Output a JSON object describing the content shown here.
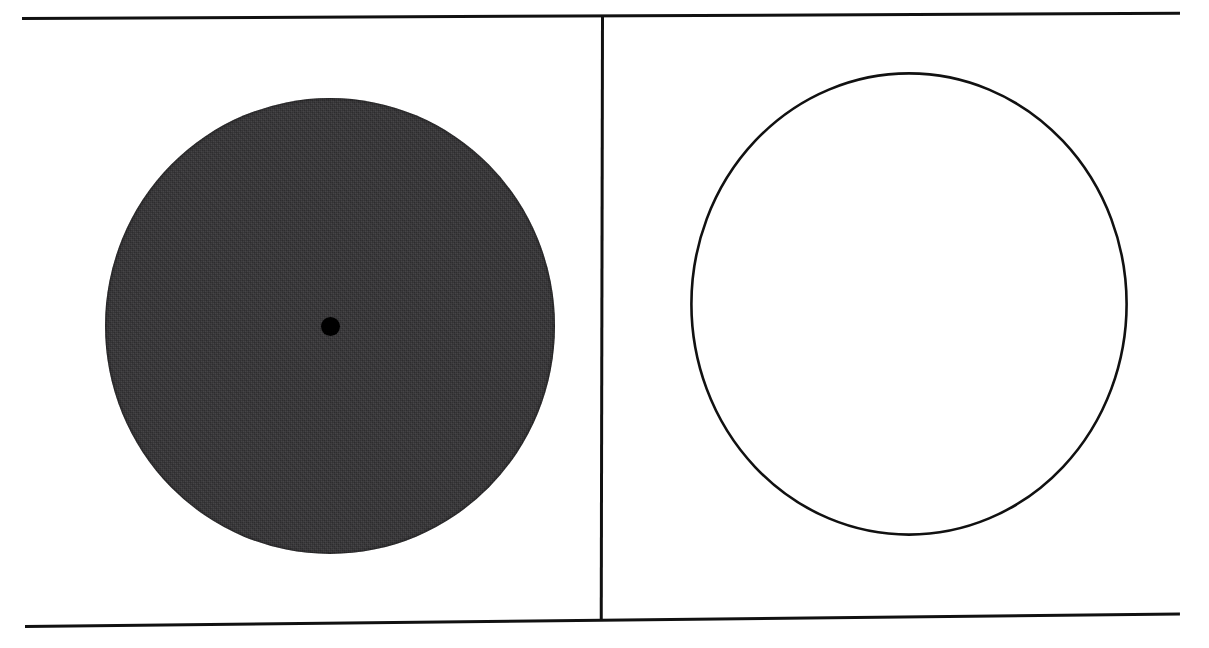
{
  "figure": {
    "background_color": "#ffffff",
    "ink_color": "#111111"
  },
  "rules": {
    "top": {
      "name": "top-rule",
      "thickness_px": 3,
      "color": "#111111"
    },
    "bottom": {
      "name": "bottom-rule",
      "thickness_px": 3,
      "color": "#111111"
    },
    "vertical": {
      "name": "vertical-rule",
      "thickness_px": 3,
      "color": "#111111"
    }
  },
  "panels": [
    {
      "id": "left",
      "shape": {
        "kind": "filled-disc",
        "fill_color": "#333234",
        "outline_color": "#2b2a2c",
        "center_x": 307,
        "center_y": 306,
        "diameter_px": 450,
        "texture": "halftone-scan"
      },
      "center_marker": {
        "kind": "dot",
        "color": "#000000",
        "diameter_px": 19,
        "center_x": 307,
        "center_y": 306
      }
    },
    {
      "id": "right",
      "shape": {
        "kind": "circle-outline",
        "fill_color": "none",
        "stroke_color": "#111111",
        "stroke_width_px": 2.4,
        "center_x": 908,
        "center_y": 304,
        "diameter_px": 438
      },
      "center_marker": null
    }
  ],
  "chart_data": {
    "type": "scatter",
    "title": "",
    "xlabel": "",
    "ylabel": "",
    "series": [
      {
        "name": "filled-disc",
        "points": [
          {
            "x": 307,
            "y": 306,
            "r": 225,
            "fill": "#333234",
            "marker": "disc"
          }
        ]
      },
      {
        "name": "center-point",
        "points": [
          {
            "x": 307,
            "y": 306,
            "r": 9.5,
            "fill": "#000000",
            "marker": "dot"
          }
        ]
      },
      {
        "name": "circle-outline",
        "points": [
          {
            "x": 908,
            "y": 304,
            "r": 219,
            "fill": "none",
            "marker": "circle"
          }
        ]
      }
    ],
    "xlim": [
      0,
      1209
    ],
    "ylim": [
      0,
      648
    ],
    "grid": false,
    "legend": "none"
  }
}
